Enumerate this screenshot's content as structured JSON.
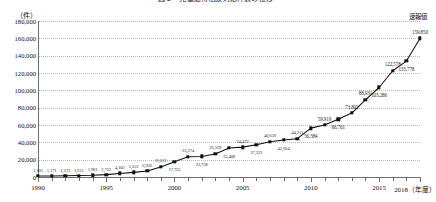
{
  "chart": {
    "title": "図１　児童虐待相談対応件数の推移",
    "unit_label": "（件）",
    "x_axis_caption": "（年度）"
  },
  "annotations": {
    "preliminary": "速報値"
  },
  "chart_data": {
    "type": "line",
    "title": "図１　児童虐待相談対応件数の推移",
    "xlabel": "（年度）",
    "ylabel": "（件）",
    "ylim": [
      0,
      180000
    ],
    "ytick_step": 20000,
    "ytick_labels": [
      "0",
      "20,000",
      "40,000",
      "60,000",
      "80,000",
      "100,000",
      "120,000",
      "140,000",
      "160,000",
      "180,000"
    ],
    "ytick_values": [
      0,
      20000,
      40000,
      60000,
      80000,
      100000,
      120000,
      140000,
      160000,
      180000
    ],
    "xtick_labels": [
      "1990",
      "1995",
      "2000",
      "2005",
      "2010",
      "2015",
      "2018"
    ],
    "xtick_values": [
      1990,
      1995,
      2000,
      2005,
      2010,
      2015,
      2018
    ],
    "grid": true,
    "legend_position": "none",
    "marker": "square",
    "x": [
      1990,
      1991,
      1992,
      1993,
      1994,
      1995,
      1996,
      1997,
      1998,
      1999,
      2000,
      2001,
      2002,
      2003,
      2004,
      2005,
      2006,
      2007,
      2008,
      2009,
      2010,
      2011,
      2012,
      2013,
      2014,
      2015,
      2016,
      2017,
      2018
    ],
    "values": [
      1101,
      1171,
      1372,
      1611,
      1961,
      2722,
      4102,
      5352,
      6932,
      11631,
      17725,
      23274,
      23738,
      26569,
      33408,
      34472,
      37323,
      40639,
      42664,
      44211,
      56384,
      59919,
      66701,
      73802,
      88931,
      103286,
      122578,
      133778,
      159850
    ],
    "data_labels": [
      "1,101",
      "1,171",
      "1,372",
      "1,611",
      "1,961",
      "2,722",
      "4,102",
      "5,352",
      "6,932",
      "11,631",
      "17,725",
      "23,274",
      "23,738",
      "26,569",
      "33,408",
      "34,472",
      "37,323",
      "40,639",
      "42,664",
      "44,211",
      "56,384",
      "59,919",
      "66,701",
      "73,802",
      "88,931",
      "103,286",
      "122,578",
      "133,778",
      "159,850"
    ],
    "annotations": [
      {
        "text": "速報値",
        "x": 2018,
        "note": "preliminary value marker on final data point"
      }
    ]
  }
}
